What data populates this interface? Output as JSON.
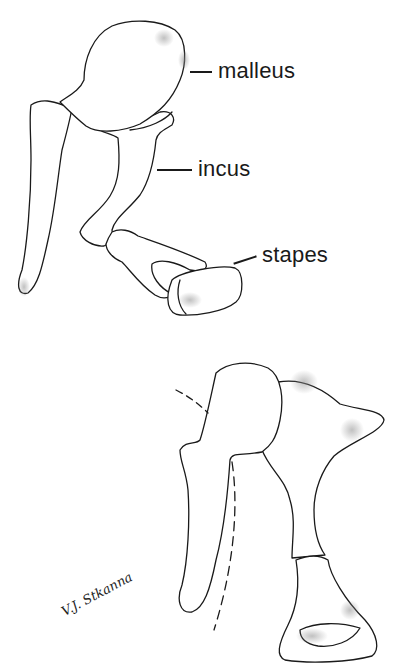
{
  "figure": {
    "upper_view": {
      "labels": [
        {
          "id": "malleus",
          "text": "malleus"
        },
        {
          "id": "incus",
          "text": "incus"
        },
        {
          "id": "stapes",
          "text": "stapes"
        }
      ]
    },
    "lower_view": {
      "labels": []
    },
    "signature": "V.J. Stkanna"
  },
  "colors": {
    "line": "#1a1a1a",
    "shade": "#9a9a9a",
    "background": "#ffffff"
  }
}
